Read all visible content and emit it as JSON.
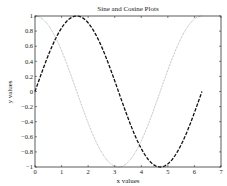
{
  "chart_data": {
    "type": "line",
    "title": "Sine and Cosine Plots",
    "xlabel": "x values",
    "ylabel": "y values",
    "xlim": [
      0,
      7
    ],
    "ylim": [
      -1,
      1
    ],
    "xticks": [
      0,
      1,
      2,
      3,
      4,
      5,
      6,
      7
    ],
    "yticks": [
      -1,
      -0.8,
      -0.6,
      -0.4,
      -0.2,
      0,
      0.2,
      0.4,
      0.6,
      0.8,
      1
    ],
    "ytick_labels": [
      "−1",
      "−0.8",
      "−0.6",
      "−0.4",
      "−0.2",
      "0",
      "0.2",
      "0.4",
      "0.6",
      "0.8",
      "1"
    ],
    "xtick_labels": [
      "0",
      "1",
      "2",
      "3",
      "4",
      "5",
      "6",
      "7"
    ],
    "grid": false,
    "legend": null,
    "x_range": [
      0,
      6.2832
    ],
    "series": [
      {
        "name": "sin(x)",
        "function": "sin",
        "style": "dashed",
        "color": "#111111",
        "width": 1.3,
        "x": [
          0,
          0.5,
          1,
          1.5708,
          2,
          2.5,
          3,
          3.1416,
          3.5,
          4,
          4.7124,
          5,
          5.5,
          6,
          6.2832
        ],
        "values": [
          0,
          0.479,
          0.841,
          1,
          0.909,
          0.598,
          0.141,
          0,
          -0.351,
          -0.757,
          -1,
          -0.959,
          -0.706,
          -0.279,
          0
        ]
      },
      {
        "name": "cos(x)",
        "function": "cos",
        "style": "dotted",
        "color": "#9a9a9a",
        "width": 0.8,
        "x": [
          0,
          0.5,
          1,
          1.5708,
          2,
          2.5,
          3,
          3.1416,
          3.5,
          4,
          4.7124,
          5,
          5.5,
          6,
          6.2832
        ],
        "values": [
          1,
          0.878,
          0.54,
          0,
          -0.416,
          -0.801,
          -0.99,
          -1,
          -0.936,
          -0.654,
          0,
          0.284,
          0.709,
          0.96,
          1
        ]
      }
    ]
  }
}
